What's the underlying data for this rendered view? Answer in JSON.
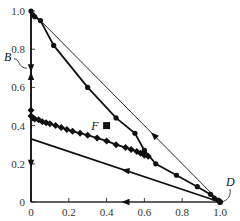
{
  "chart_data": {
    "type": "line",
    "title": "",
    "xlabel": "",
    "ylabel": "",
    "xlim": [
      0,
      1.0
    ],
    "ylim": [
      0,
      1.0
    ],
    "grid": false,
    "x_ticks": [
      "0",
      "0.2",
      "0.4",
      "0.6",
      "0.8",
      "1.0"
    ],
    "y_ticks": [
      "0",
      "0.2",
      "0.4",
      "0.6",
      "0.8",
      "1.0"
    ],
    "annotations": [
      {
        "label": "B",
        "x": 0.0,
        "y": 0.7
      },
      {
        "label": "D",
        "x": 1.0,
        "y": 0.0
      },
      {
        "label": "F",
        "x": 0.4,
        "y": 0.4,
        "marker": "square"
      }
    ],
    "series": [
      {
        "name": "thin-line-D-to-top",
        "style": "thin",
        "marker": "none",
        "arrow": "up-left",
        "x": [
          1.0,
          0.0
        ],
        "y": [
          0.0,
          1.0
        ]
      },
      {
        "name": "thick-curve-circles",
        "style": "thick",
        "marker": "circle",
        "x": [
          0.0,
          0.01,
          0.02,
          0.05,
          0.12,
          0.3,
          0.45,
          0.55,
          0.6,
          0.66,
          0.77,
          0.88,
          0.95,
          0.97,
          0.99,
          1.0
        ],
        "y": [
          1.0,
          0.98,
          0.97,
          0.95,
          0.82,
          0.6,
          0.44,
          0.36,
          0.27,
          0.2,
          0.14,
          0.08,
          0.04,
          0.02,
          0.01,
          0.0
        ]
      },
      {
        "name": "diamond-curve",
        "style": "thick",
        "marker": "diamond",
        "x": [
          0.0,
          0.0,
          0.01,
          0.02,
          0.04,
          0.06,
          0.08,
          0.1,
          0.13,
          0.16,
          0.19,
          0.22,
          0.26,
          0.3,
          0.35,
          0.4,
          0.45,
          0.5,
          0.53,
          0.56,
          0.58,
          0.6,
          0.62
        ],
        "y": [
          0.48,
          0.45,
          0.44,
          0.435,
          0.43,
          0.42,
          0.415,
          0.41,
          0.4,
          0.39,
          0.38,
          0.37,
          0.36,
          0.35,
          0.335,
          0.32,
          0.3,
          0.285,
          0.275,
          0.265,
          0.255,
          0.245,
          0.24
        ]
      },
      {
        "name": "lower-line",
        "style": "thick",
        "marker": "none",
        "arrow": "left",
        "x": [
          0.0,
          1.0
        ],
        "y": [
          0.33,
          0.0
        ]
      },
      {
        "name": "y-axis-path",
        "style": "thick",
        "marker": "arrows",
        "x": [
          0.0,
          0.0
        ],
        "y": [
          1.0,
          0.0
        ],
        "arrows": [
          {
            "y": 0.7,
            "direction": "down"
          },
          {
            "y": 0.66,
            "direction": "up"
          },
          {
            "y": 0.2,
            "direction": "down"
          }
        ]
      },
      {
        "name": "x-axis-path",
        "style": "thin",
        "marker": "none",
        "arrow": "left",
        "x": [
          1.0,
          0.0
        ],
        "y": [
          0.0,
          0.0
        ]
      }
    ]
  }
}
